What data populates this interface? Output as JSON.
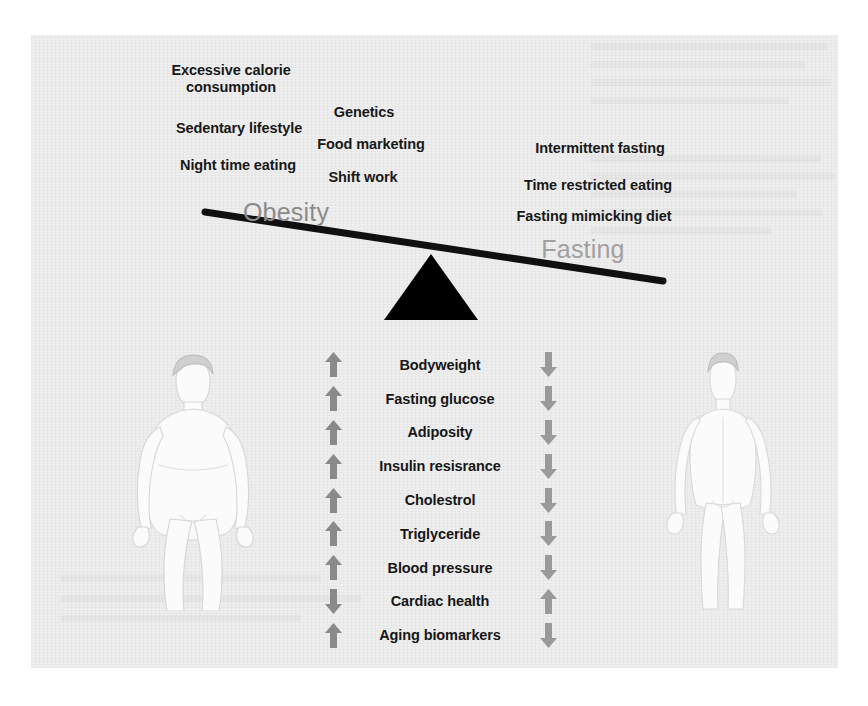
{
  "figure": {
    "left_side_title": "Obesity",
    "right_side_title": "Fasting",
    "fulcrum_icon": "triangle-fulcrum-icon",
    "beam_icon": "balance-beam-icon",
    "left_silhouette": "obese-body-silhouette",
    "right_silhouette": "lean-body-silhouette",
    "background_color": "#eeeeee",
    "beam_color": "#101010",
    "obesity_label_color": "#8b8b8b",
    "fasting_label_color": "#a0a0a0",
    "up_arrow_color": "#8a8a8a",
    "down_arrow_color": "#9a9a9a"
  },
  "obesity_causes": [
    {
      "text": "Excessive calorie\nconsumption",
      "x": 231,
      "y": 62
    },
    {
      "text": "Genetics",
      "x": 364,
      "y": 104
    },
    {
      "text": "Sedentary lifestyle",
      "x": 239,
      "y": 120
    },
    {
      "text": "Food marketing",
      "x": 371,
      "y": 136
    },
    {
      "text": "Night time eating",
      "x": 238,
      "y": 157
    },
    {
      "text": "Shift work",
      "x": 363,
      "y": 169
    }
  ],
  "fasting_interventions": [
    {
      "text": "Intermittent fasting",
      "x": 600,
      "y": 140
    },
    {
      "text": "Time restricted eating",
      "x": 598,
      "y": 177
    },
    {
      "text": "Fasting mimicking diet",
      "x": 594,
      "y": 208
    }
  ],
  "biomarkers": [
    {
      "label": "Bodyweight",
      "obesity_direction": "up",
      "fasting_direction": "down"
    },
    {
      "label": "Fasting glucose",
      "obesity_direction": "up",
      "fasting_direction": "down"
    },
    {
      "label": "Adiposity",
      "obesity_direction": "up",
      "fasting_direction": "down"
    },
    {
      "label": "Insulin resisrance",
      "obesity_direction": "up",
      "fasting_direction": "down"
    },
    {
      "label": "Cholestrol",
      "obesity_direction": "up",
      "fasting_direction": "down"
    },
    {
      "label": "Triglyceride",
      "obesity_direction": "up",
      "fasting_direction": "down"
    },
    {
      "label": "Blood pressure",
      "obesity_direction": "up",
      "fasting_direction": "down"
    },
    {
      "label": "Cardiac health",
      "obesity_direction": "down",
      "fasting_direction": "up"
    },
    {
      "label": "Aging biomarkers",
      "obesity_direction": "up",
      "fasting_direction": "down"
    }
  ]
}
